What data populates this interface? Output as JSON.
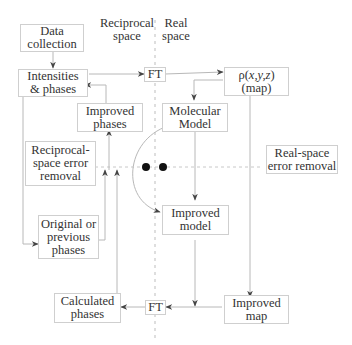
{
  "headers": {
    "reciprocal": "Reciprocal\nspace",
    "real": "Real\nspace"
  },
  "nodes": {
    "data_collection": "Data\ncollection",
    "intensities": "Intensities\n& phases",
    "ft_top": "FT",
    "rho_map_line1_prefix": "ρ(",
    "rho_map_vars": "x,y,z",
    "rho_map_line1_suffix": ")",
    "rho_map_line2": "(map)",
    "improved_phases": "Improved\nphases",
    "molecular_model": "Molecular\nModel",
    "reciprocal_error": "Reciprocal-\nspace error\nremoval",
    "real_error": "Real-space\nerror removal",
    "improved_model": "Improved\nmodel",
    "original_phases": "Original or\nprevious\nphases",
    "calculated_phases": "Calculated\nphases",
    "ft_bottom": "FT",
    "improved_map": "Improved\nmap"
  },
  "colors": {
    "line": "#b8b8b8",
    "dashed": "#c8c8c8",
    "arrow": "#444444",
    "dot": "#111111"
  }
}
